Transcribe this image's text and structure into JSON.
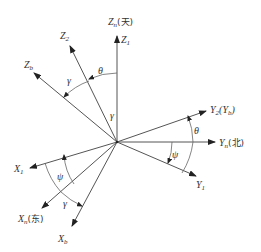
{
  "diagram": {
    "type": "coordinate-frame-rotation",
    "origin": [
      117,
      142
    ],
    "axes": {
      "Zn": {
        "label": "Z",
        "sub": "n",
        "suffix": "(天)",
        "end": [
          117,
          36
        ]
      },
      "Z1": {
        "label": "Z",
        "sub": "1"
      },
      "Z2": {
        "label": "Z",
        "sub": "2",
        "end": [
          70,
          46
        ]
      },
      "Zb": {
        "label": "Z",
        "sub": "b",
        "end": [
          34,
          73
        ]
      },
      "Y2": {
        "label": "Y",
        "sub": "2",
        "suffix_open": "(Y",
        "suffix_sub": "b",
        "suffix_close": ")",
        "end": [
          206,
          111
        ]
      },
      "Yn": {
        "label": "Y",
        "sub": "n",
        "suffix": "(北)",
        "end": [
          215,
          142
        ]
      },
      "Y1": {
        "label": "Y",
        "sub": "1",
        "end": [
          196,
          176
        ]
      },
      "X1": {
        "label": "X",
        "sub": "1",
        "end": [
          30,
          168
        ]
      },
      "Xn": {
        "label": "X",
        "sub": "n",
        "suffix": "(东)",
        "end": [
          42,
          208
        ]
      },
      "Xb": {
        "label": "X",
        "sub": "b",
        "end": [
          72,
          226
        ]
      }
    },
    "angles": {
      "theta_top": "θ",
      "gamma_top": "γ",
      "gamma_mid": "γ",
      "theta_right": "θ",
      "psi_right": "ψ",
      "psi_left": "ψ",
      "gamma_bottom": "γ"
    }
  }
}
